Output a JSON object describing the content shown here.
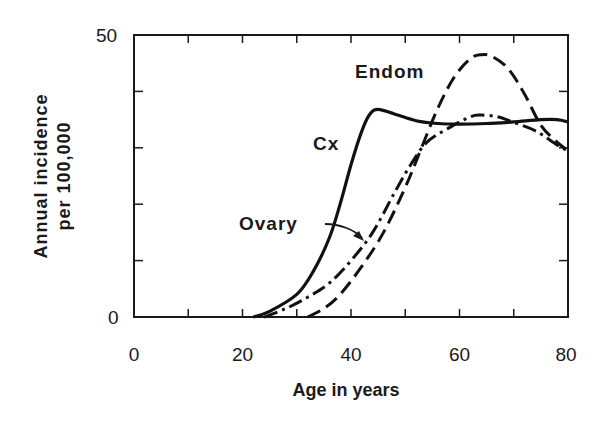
{
  "chart_data": {
    "type": "line",
    "title": "",
    "xlabel": "Age in years",
    "ylabel_lines": [
      "Annual incidence",
      "per 100,000"
    ],
    "xlim": [
      0,
      80
    ],
    "ylim": [
      0,
      50
    ],
    "x_tick_labels": [
      "0",
      "20",
      "40",
      "60",
      "80"
    ],
    "y_tick_labels": [
      "0",
      "50"
    ],
    "x_minor_tick_step": 10,
    "y_minor_tick_step": 10,
    "grid": false,
    "legend": "inline labels",
    "series": [
      {
        "name": "Cx",
        "style": "solid",
        "x": [
          22,
          25,
          30,
          33,
          36,
          38,
          40,
          42,
          43.5,
          45,
          48,
          52,
          56,
          60,
          65,
          70,
          75,
          78,
          80
        ],
        "values": [
          0,
          1,
          4,
          8,
          14,
          20,
          27,
          33,
          36,
          36.8,
          36,
          34.8,
          34.3,
          34.2,
          34.3,
          34.6,
          35,
          35,
          34.6
        ]
      },
      {
        "name": "Ovary",
        "style": "dash-dot",
        "x": [
          24,
          28,
          32,
          36,
          40,
          44,
          48,
          51,
          54,
          58,
          62,
          64,
          67,
          70,
          74,
          78,
          80
        ],
        "values": [
          0,
          1.5,
          3.5,
          6,
          10,
          15,
          22,
          27,
          31,
          33.5,
          35.5,
          35.8,
          35.5,
          34.5,
          33,
          30.5,
          29.5
        ]
      },
      {
        "name": "Endom",
        "style": "dashed",
        "x": [
          32,
          35,
          38,
          42,
          46,
          50,
          53,
          56,
          59,
          62,
          64,
          66,
          69,
          72,
          75,
          78,
          80
        ],
        "values": [
          0,
          1.5,
          4,
          9,
          15,
          23,
          30,
          37,
          42.5,
          45.8,
          46.5,
          46.2,
          44,
          39.5,
          34,
          31,
          29.5
        ]
      }
    ],
    "annotations": [
      {
        "text": "Endom",
        "x": 48,
        "y": 44
      },
      {
        "text": "Cx",
        "x": 36,
        "y": 30.5
      },
      {
        "text": "Ovary",
        "x": 19,
        "y": 15.5,
        "arrow_to": {
          "x": 42,
          "y": 12
        }
      }
    ]
  }
}
